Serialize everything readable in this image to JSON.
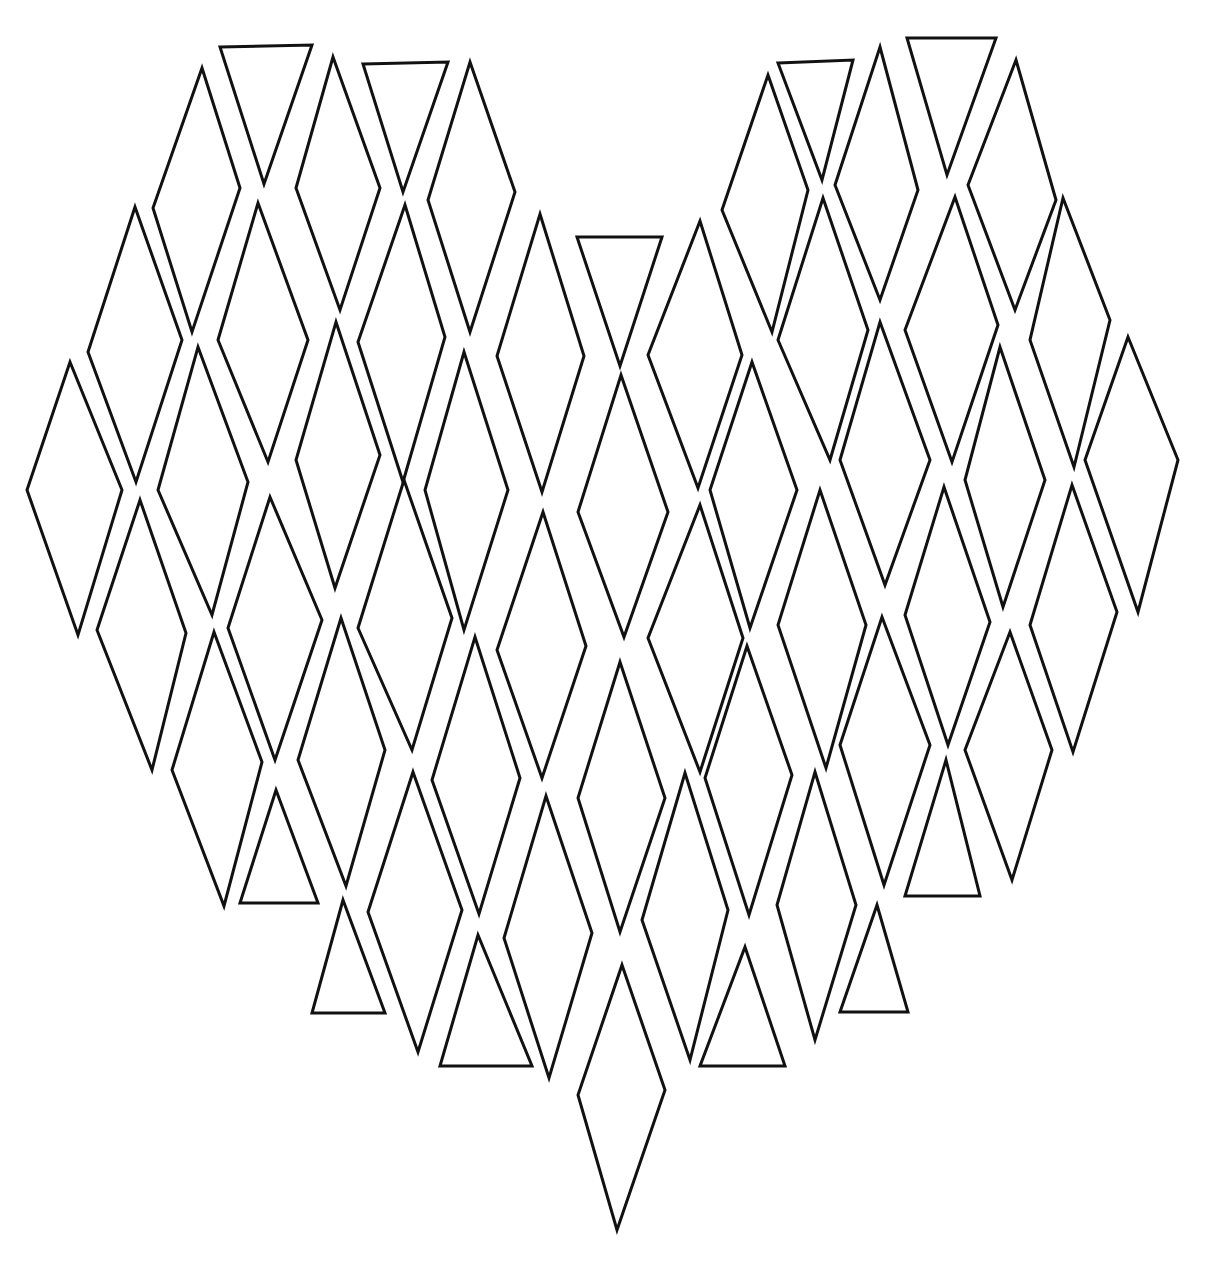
{
  "illustration": {
    "subject": "heart made of diamonds and triangles",
    "style": "hand-drawn line art",
    "background_color": "#ffffff",
    "stroke_color": "#111111",
    "stroke_width": 3,
    "width": 1218,
    "height": 1268,
    "shapes": [
      {
        "type": "diamond",
        "points": [
          [
            202,
            68
          ],
          [
            240,
            188
          ],
          [
            192,
            332
          ],
          [
            153,
            208
          ]
        ]
      },
      {
        "type": "triangle",
        "points": [
          [
            220,
            47
          ],
          [
            312,
            45
          ],
          [
            264,
            184
          ]
        ]
      },
      {
        "type": "diamond",
        "points": [
          [
            333,
            57
          ],
          [
            380,
            188
          ],
          [
            340,
            310
          ],
          [
            296,
            188
          ]
        ]
      },
      {
        "type": "triangle",
        "points": [
          [
            363,
            64
          ],
          [
            448,
            62
          ],
          [
            403,
            192
          ]
        ]
      },
      {
        "type": "diamond",
        "points": [
          [
            470,
            62
          ],
          [
            515,
            192
          ],
          [
            470,
            332
          ],
          [
            428,
            200
          ]
        ]
      },
      {
        "type": "diamond",
        "points": [
          [
            135,
            207
          ],
          [
            182,
            340
          ],
          [
            136,
            482
          ],
          [
            88,
            352
          ]
        ]
      },
      {
        "type": "diamond",
        "points": [
          [
            258,
            203
          ],
          [
            308,
            340
          ],
          [
            268,
            462
          ],
          [
            218,
            340
          ]
        ]
      },
      {
        "type": "diamond",
        "points": [
          [
            405,
            205
          ],
          [
            445,
            337
          ],
          [
            403,
            482
          ],
          [
            358,
            342
          ]
        ]
      },
      {
        "type": "diamond",
        "points": [
          [
            70,
            362
          ],
          [
            122,
            490
          ],
          [
            78,
            635
          ],
          [
            27,
            490
          ]
        ]
      },
      {
        "type": "diamond",
        "points": [
          [
            198,
            347
          ],
          [
            248,
            482
          ],
          [
            212,
            615
          ],
          [
            158,
            490
          ]
        ]
      },
      {
        "type": "diamond",
        "points": [
          [
            336,
            322
          ],
          [
            380,
            455
          ],
          [
            335,
            588
          ],
          [
            296,
            460
          ]
        ]
      },
      {
        "type": "diamond",
        "points": [
          [
            464,
            352
          ],
          [
            508,
            490
          ],
          [
            464,
            630
          ],
          [
            425,
            490
          ]
        ]
      },
      {
        "type": "diamond",
        "points": [
          [
            540,
            214
          ],
          [
            584,
            356
          ],
          [
            542,
            492
          ],
          [
            497,
            356
          ]
        ]
      },
      {
        "type": "triangle",
        "points": [
          [
            577,
            237
          ],
          [
            662,
            237
          ],
          [
            620,
            366
          ]
        ]
      },
      {
        "type": "diamond",
        "points": [
          [
            700,
            221
          ],
          [
            742,
            355
          ],
          [
            698,
            488
          ],
          [
            648,
            355
          ]
        ]
      },
      {
        "type": "diamond",
        "points": [
          [
            140,
            500
          ],
          [
            186,
            633
          ],
          [
            152,
            770
          ],
          [
            97,
            630
          ]
        ]
      },
      {
        "type": "diamond",
        "points": [
          [
            270,
            497
          ],
          [
            322,
            620
          ],
          [
            275,
            760
          ],
          [
            228,
            628
          ]
        ]
      },
      {
        "type": "diamond",
        "points": [
          [
            404,
            480
          ],
          [
            452,
            618
          ],
          [
            412,
            750
          ],
          [
            358,
            628
          ]
        ]
      },
      {
        "type": "diamond",
        "points": [
          [
            543,
            512
          ],
          [
            586,
            646
          ],
          [
            542,
            778
          ],
          [
            497,
            650
          ]
        ]
      },
      {
        "type": "diamond",
        "points": [
          [
            621,
            375
          ],
          [
            668,
            512
          ],
          [
            624,
            637
          ],
          [
            578,
            512
          ]
        ]
      },
      {
        "type": "diamond",
        "points": [
          [
            700,
            505
          ],
          [
            743,
            638
          ],
          [
            700,
            772
          ],
          [
            648,
            638
          ]
        ]
      },
      {
        "type": "diamond",
        "points": [
          [
            214,
            632
          ],
          [
            262,
            762
          ],
          [
            224,
            906
          ],
          [
            172,
            770
          ]
        ]
      },
      {
        "type": "triangle",
        "points": [
          [
            276,
            790
          ],
          [
            318,
            903
          ],
          [
            240,
            903
          ]
        ]
      },
      {
        "type": "diamond",
        "points": [
          [
            341,
            618
          ],
          [
            385,
            750
          ],
          [
            346,
            886
          ],
          [
            298,
            760
          ]
        ]
      },
      {
        "type": "diamond",
        "points": [
          [
            475,
            637
          ],
          [
            520,
            778
          ],
          [
            479,
            914
          ],
          [
            432,
            780
          ]
        ]
      },
      {
        "type": "diamond",
        "points": [
          [
            620,
            662
          ],
          [
            665,
            798
          ],
          [
            620,
            932
          ],
          [
            578,
            798
          ]
        ]
      },
      {
        "type": "diamond",
        "points": [
          [
            413,
            772
          ],
          [
            462,
            910
          ],
          [
            418,
            1052
          ],
          [
            368,
            912
          ]
        ]
      },
      {
        "type": "diamond",
        "points": [
          [
            546,
            796
          ],
          [
            592,
            933
          ],
          [
            549,
            1078
          ],
          [
            504,
            938
          ]
        ]
      },
      {
        "type": "triangle",
        "points": [
          [
            343,
            900
          ],
          [
            385,
            1013
          ],
          [
            312,
            1013
          ]
        ]
      },
      {
        "type": "triangle",
        "points": [
          [
            478,
            935
          ],
          [
            532,
            1066
          ],
          [
            440,
            1066
          ]
        ]
      },
      {
        "type": "diamond",
        "points": [
          [
            622,
            965
          ],
          [
            665,
            1090
          ],
          [
            617,
            1230
          ],
          [
            578,
            1095
          ]
        ]
      },
      {
        "type": "diamond",
        "points": [
          [
            768,
            75
          ],
          [
            808,
            190
          ],
          [
            772,
            332
          ],
          [
            722,
            210
          ]
        ]
      },
      {
        "type": "triangle",
        "points": [
          [
            778,
            63
          ],
          [
            853,
            60
          ],
          [
            822,
            180
          ]
        ]
      },
      {
        "type": "diamond",
        "points": [
          [
            880,
            47
          ],
          [
            918,
            190
          ],
          [
            880,
            300
          ],
          [
            835,
            185
          ]
        ]
      },
      {
        "type": "triangle",
        "points": [
          [
            907,
            38
          ],
          [
            996,
            38
          ],
          [
            947,
            175
          ]
        ]
      },
      {
        "type": "diamond",
        "points": [
          [
            1016,
            60
          ],
          [
            1056,
            200
          ],
          [
            1015,
            310
          ],
          [
            968,
            185
          ]
        ]
      },
      {
        "type": "diamond",
        "points": [
          [
            823,
            198
          ],
          [
            868,
            330
          ],
          [
            830,
            460
          ],
          [
            778,
            340
          ]
        ]
      },
      {
        "type": "diamond",
        "points": [
          [
            955,
            197
          ],
          [
            998,
            325
          ],
          [
            952,
            462
          ],
          [
            905,
            330
          ]
        ]
      },
      {
        "type": "diamond",
        "points": [
          [
            1063,
            198
          ],
          [
            1110,
            320
          ],
          [
            1074,
            467
          ],
          [
            1030,
            340
          ]
        ]
      },
      {
        "type": "diamond",
        "points": [
          [
            752,
            362
          ],
          [
            797,
            490
          ],
          [
            750,
            628
          ],
          [
            710,
            490
          ]
        ]
      },
      {
        "type": "diamond",
        "points": [
          [
            880,
            322
          ],
          [
            930,
            460
          ],
          [
            885,
            585
          ],
          [
            840,
            460
          ]
        ]
      },
      {
        "type": "diamond",
        "points": [
          [
            1000,
            347
          ],
          [
            1045,
            480
          ],
          [
            1003,
            607
          ],
          [
            965,
            480
          ]
        ]
      },
      {
        "type": "diamond",
        "points": [
          [
            1128,
            337
          ],
          [
            1178,
            460
          ],
          [
            1138,
            612
          ],
          [
            1085,
            460
          ]
        ]
      },
      {
        "type": "diamond",
        "points": [
          [
            820,
            490
          ],
          [
            866,
            625
          ],
          [
            826,
            768
          ],
          [
            778,
            625
          ]
        ]
      },
      {
        "type": "diamond",
        "points": [
          [
            944,
            487
          ],
          [
            990,
            622
          ],
          [
            948,
            745
          ],
          [
            905,
            615
          ]
        ]
      },
      {
        "type": "diamond",
        "points": [
          [
            1072,
            485
          ],
          [
            1117,
            612
          ],
          [
            1073,
            752
          ],
          [
            1030,
            625
          ]
        ]
      },
      {
        "type": "diamond",
        "points": [
          [
            747,
            646
          ],
          [
            792,
            775
          ],
          [
            749,
            915
          ],
          [
            705,
            778
          ]
        ]
      },
      {
        "type": "diamond",
        "points": [
          [
            882,
            617
          ],
          [
            930,
            745
          ],
          [
            884,
            885
          ],
          [
            840,
            745
          ]
        ]
      },
      {
        "type": "diamond",
        "points": [
          [
            1010,
            632
          ],
          [
            1052,
            750
          ],
          [
            1012,
            880
          ],
          [
            965,
            750
          ]
        ]
      },
      {
        "type": "triangle",
        "points": [
          [
            946,
            760
          ],
          [
            980,
            896
          ],
          [
            905,
            896
          ]
        ]
      },
      {
        "type": "diamond",
        "points": [
          [
            685,
            773
          ],
          [
            728,
            910
          ],
          [
            690,
            1060
          ],
          [
            642,
            920
          ]
        ]
      },
      {
        "type": "diamond",
        "points": [
          [
            815,
            772
          ],
          [
            856,
            905
          ],
          [
            815,
            1040
          ],
          [
            777,
            905
          ]
        ]
      },
      {
        "type": "triangle",
        "points": [
          [
            745,
            947
          ],
          [
            785,
            1066
          ],
          [
            700,
            1066
          ]
        ]
      },
      {
        "type": "triangle",
        "points": [
          [
            877,
            905
          ],
          [
            908,
            1012
          ],
          [
            840,
            1012
          ]
        ]
      }
    ]
  }
}
